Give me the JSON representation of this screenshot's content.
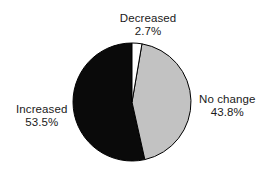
{
  "chart_data": {
    "type": "pie",
    "title": "",
    "categories": [
      "Decreased",
      "No change",
      "Increased"
    ],
    "values": [
      2.7,
      43.8,
      53.5
    ],
    "value_labels": [
      "2.7%",
      "43.8%",
      "53.5%"
    ],
    "units": "percent",
    "slice_colors": [
      "#ffffff",
      "#c2c2c2",
      "#0a0a0a"
    ],
    "outline_color": "#000000",
    "start_angle_deg": 0,
    "direction": "clockwise",
    "legend": "none",
    "labels_position": "outside",
    "grid": false,
    "background": "#ffffff"
  },
  "labels": {
    "decreased": {
      "name": "Decreased",
      "value": "2.7%"
    },
    "no_change": {
      "name": "No change",
      "value": "43.8%"
    },
    "increased": {
      "name": "Increased",
      "value": "53.5%"
    }
  }
}
